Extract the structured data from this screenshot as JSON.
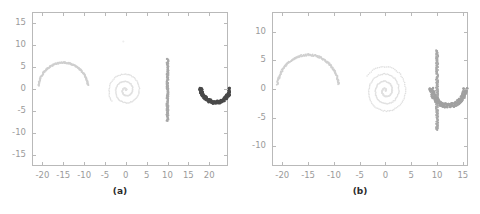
{
  "figure": {
    "panels": [
      {
        "id": "panel-a",
        "caption": "(a)",
        "xlim": [
          -22.5,
          24.5
        ],
        "ylim": [
          -17.5,
          17.5
        ],
        "xticks": [
          -20,
          -15,
          -10,
          -5,
          0,
          5,
          10,
          15,
          20
        ],
        "yticks": [
          15,
          10,
          5,
          0,
          -5,
          -10,
          -15
        ],
        "xticklabels": [
          "-20",
          "-15",
          "-10",
          "-5",
          "0",
          "5",
          "10",
          "15",
          "20"
        ],
        "yticklabels": [
          "15",
          "10",
          "5",
          "0",
          "-5",
          "-10",
          "-15"
        ],
        "grid": false,
        "legend": "none"
      },
      {
        "id": "panel-b",
        "caption": "(b)",
        "xlim": [
          -22.0,
          16.0
        ],
        "ylim": [
          -13.5,
          13.5
        ],
        "xticks": [
          -20,
          -15,
          -10,
          -5,
          0,
          5,
          10,
          15
        ],
        "yticks": [
          10,
          5,
          0,
          -5,
          -10
        ],
        "xticklabels": [
          "-20",
          "-15",
          "-10",
          "-5",
          "0",
          "5",
          "10",
          "15"
        ],
        "yticklabels": [
          "10",
          "5",
          "0",
          "-5",
          "-10"
        ],
        "grid": false,
        "legend": "none"
      }
    ]
  },
  "colors": {
    "arc_light": "#cfcfcf",
    "spiral_faint": "#e0e0e0",
    "line_mid": "#a8a8a8",
    "u_dark": "#4a4a4a",
    "axis": "#b9b9b9",
    "ticklabel": "#9a9a9a",
    "caption": "#2b2b2b",
    "background": "#ffffff"
  },
  "chart_data": [
    {
      "type": "scatter",
      "title": "(a)",
      "xlabel": "",
      "ylabel": "",
      "xlim": [
        -22.5,
        24.5
      ],
      "ylim": [
        -17.5,
        17.5
      ],
      "grid": false,
      "legend": "none",
      "series": [
        {
          "name": "upper-arc-cluster",
          "color": "#cfcfcf",
          "shape": "arc",
          "description": "semicircular arc, center (-15,0), radius 6, angles 10 to 172 degrees",
          "center": [
            -15.0,
            0.0
          ],
          "radius": 6.0,
          "angle_start_deg": 8,
          "angle_end_deg": 173,
          "n_points": 200
        },
        {
          "name": "spiral-cluster",
          "color": "#e0e0e0",
          "shape": "spiral",
          "description": "archimedean spiral centered near (0,-0.3), 2.6 turns, max radius 4.2",
          "center": [
            0.0,
            -0.3
          ],
          "turns": 2.6,
          "r_max": 4.2,
          "n_points": 180
        },
        {
          "name": "vertical-line-cluster",
          "color": "#a8a8a8",
          "shape": "line-vertical",
          "description": "near-vertical strip at x = 10, y from -7.3 to 6.9",
          "x": 10.0,
          "y_min": -7.3,
          "y_max": 6.9,
          "jitter_x": 0.25,
          "n_points": 170
        },
        {
          "name": "u-arc-cluster",
          "color": "#4a4a4a",
          "shape": "arc",
          "description": "thick U-shaped arc, center (21.5,0.6), radius 3.6, lower half",
          "center": [
            21.5,
            0.6
          ],
          "radius": 3.6,
          "angle_start_deg": 186,
          "angle_end_deg": 354,
          "n_points": 190
        },
        {
          "name": "outlier-point",
          "color": "#ededed",
          "shape": "point",
          "description": "single faint stray point above the spiral",
          "points": [
            [
              -0.6,
              10.8
            ]
          ],
          "n_points": 1
        }
      ]
    },
    {
      "type": "scatter",
      "title": "(b)",
      "xlabel": "",
      "ylabel": "",
      "xlim": [
        -22.0,
        16.0
      ],
      "ylim": [
        -13.5,
        13.5
      ],
      "grid": false,
      "legend": "none",
      "series": [
        {
          "name": "upper-arc-cluster",
          "color": "#cfcfcf",
          "shape": "arc",
          "description": "semicircular arc, center (-15,0), radius 6, angles 8 to 173 degrees",
          "center": [
            -15.0,
            0.0
          ],
          "radius": 6.0,
          "angle_start_deg": 8,
          "angle_end_deg": 173,
          "n_points": 200
        },
        {
          "name": "spiral-cluster",
          "color": "#e0e0e0",
          "shape": "spiral",
          "description": "archimedean spiral centered near (0,-0.3), 3.4 turns, max radius 4.4, denser windings",
          "center": [
            0.0,
            -0.3
          ],
          "turns": 3.4,
          "r_max": 4.4,
          "n_points": 260
        },
        {
          "name": "vertical-line-cluster",
          "color": "#a8a8a8",
          "shape": "line-vertical",
          "description": "near-vertical strip at x = 10, y from -7.2 to 6.8",
          "x": 10.0,
          "y_min": -7.2,
          "y_max": 6.8,
          "jitter_x": 0.22,
          "n_points": 190
        },
        {
          "name": "u-arc-cluster",
          "color": "#a0a0a0",
          "shape": "arc",
          "description": "U-shaped arc, center (12.2,0.4), radius 3.3, lower half, overlapping vertical line to form a J",
          "center": [
            12.2,
            0.4
          ],
          "radius": 3.3,
          "angle_start_deg": 184,
          "angle_end_deg": 356,
          "n_points": 170
        }
      ]
    }
  ]
}
